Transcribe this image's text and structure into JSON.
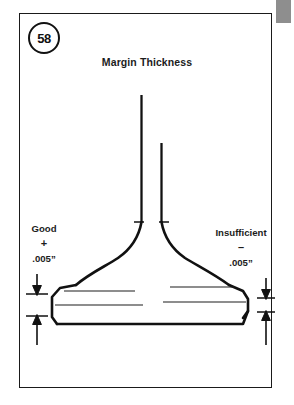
{
  "page": {
    "width": 294,
    "height": 405,
    "background_color": "#ffffff",
    "frame_color": "#1a1a1a",
    "ink_color": "#111111",
    "gray_tab_color": "#8e8e8e"
  },
  "figure": {
    "badge_number": "58",
    "title": "Margin Thickness"
  },
  "labels": {
    "left": {
      "name": "Good",
      "sign": "+",
      "value": ".005”"
    },
    "right": {
      "name": "Insufficient",
      "sign": "–",
      "value": ".005”"
    }
  },
  "diagram": {
    "type": "line-drawing",
    "left_margin_condition": "Good",
    "right_margin_condition": "Insufficient",
    "tolerance": ".005”"
  }
}
